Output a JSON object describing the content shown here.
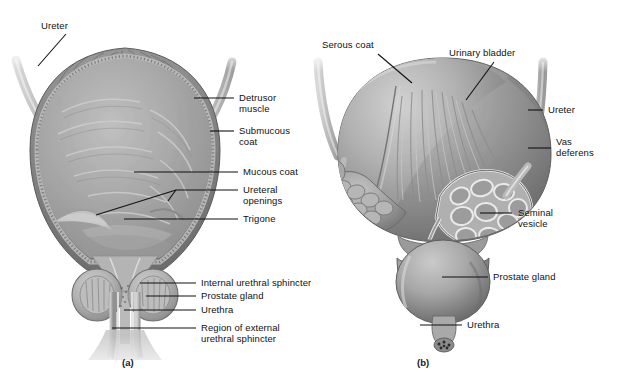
{
  "figure": {
    "background_color": "#ffffff",
    "line_color": "#111111",
    "text_color": "#111111",
    "panels": [
      {
        "id": "a",
        "caption": "(a)",
        "title": "Urinary bladder, frontal section"
      },
      {
        "id": "b",
        "caption": "(b)",
        "title": "Urinary bladder and prostate, anterior view"
      }
    ]
  },
  "panel_a": {
    "caption": "(a)",
    "labels": {
      "ureter": "Ureter",
      "detrusor_muscle_line1": "Detrusor",
      "detrusor_muscle_line2": "muscle",
      "submucous_coat_line1": "Submucous",
      "submucous_coat_line2": "coat",
      "mucous_coat": "Mucous coat",
      "ureteral_openings_line1": "Ureteral",
      "ureteral_openings_line2": "openings",
      "trigone": "Trigone",
      "internal_urethral_sphincter": "Internal urethral sphincter",
      "prostate_gland": "Prostate gland",
      "urethra": "Urethra",
      "region_external_sphincter_line1": "Region of external",
      "region_external_sphincter_line2": "urethral sphincter"
    }
  },
  "panel_b": {
    "caption": "(b)",
    "labels": {
      "serous_coat": "Serous coat",
      "urinary_bladder": "Urinary bladder",
      "ureter": "Ureter",
      "vas_deferens_line1": "Vas",
      "vas_deferens_line2": "deferens",
      "seminal_vesicle_line1": "Seminal",
      "seminal_vesicle_line2": "vesicle",
      "prostate_gland": "Prostate gland",
      "urethra": "Urethra"
    }
  },
  "colors": {
    "tissue_light": "#c9c9c9",
    "tissue_mid": "#a6a6a6",
    "tissue_dark": "#7e7e7e",
    "tissue_darker": "#636363",
    "outline": "#5a5a5a",
    "leader_line": "#111111"
  }
}
